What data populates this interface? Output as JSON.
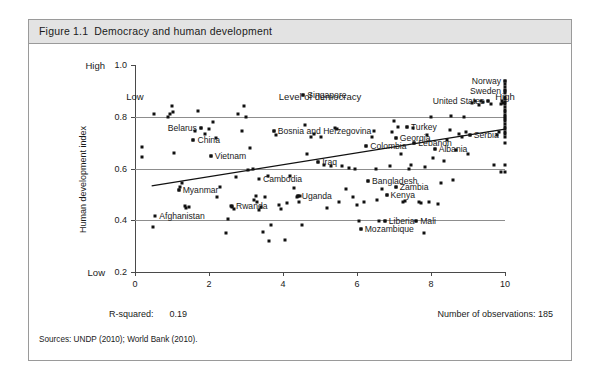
{
  "figure": {
    "number": "Figure 1.1",
    "title": "Democracy and human development"
  },
  "footer": {
    "rsquared_label": "R-squared:",
    "rsquared_value": "0.19",
    "observations": "Number of observations: 185",
    "sources": "Sources: UNDP (2010); World Bank (2010)."
  },
  "chart_data": {
    "type": "scatter",
    "title": "Democracy and human development",
    "xlabel": "Level of democracy",
    "ylabel": "Human development index",
    "xlim": [
      0,
      10
    ],
    "ylim": [
      0.2,
      1.0
    ],
    "xticks": [
      "0",
      "2",
      "4",
      "6",
      "8",
      "10"
    ],
    "xtick_values": [
      0,
      2,
      4,
      6,
      8,
      10
    ],
    "yticks": [
      "1.0",
      "0.8",
      "0.6",
      "0.4",
      "0.2"
    ],
    "ytick_values": [
      1.0,
      0.8,
      0.6,
      0.4,
      0.2
    ],
    "x_low_label": "Low",
    "x_high_label": "High",
    "y_low_label": "Low",
    "y_high_label": "High",
    "grid": "horizontal gridlines at 0.8, 0.6, 0.4",
    "gridline_values": [
      0.8,
      0.6,
      0.4
    ],
    "legend": "none",
    "r_squared": 0.19,
    "n_observations": 185,
    "marker_color": "#111111",
    "trendline": {
      "type": "linear fit",
      "x_start": 0.45,
      "y_start": 0.533,
      "x_end": 10.0,
      "y_end": 0.752,
      "color": "#111111"
    },
    "labeled_points": [
      {
        "name": "Singapore",
        "x": 4.55,
        "y": 0.885,
        "label_side": "right"
      },
      {
        "name": "Norway",
        "x": 10.0,
        "y": 0.94,
        "label_side": "left"
      },
      {
        "name": "Sweden",
        "x": 10.0,
        "y": 0.9,
        "label_side": "left"
      },
      {
        "name": "United States",
        "x": 9.55,
        "y": 0.86,
        "label_side": "left"
      },
      {
        "name": "Belarus",
        "x": 1.78,
        "y": 0.755,
        "label_side": "left"
      },
      {
        "name": "China",
        "x": 1.58,
        "y": 0.71,
        "label_side": "right"
      },
      {
        "name": "Vietnam",
        "x": 2.05,
        "y": 0.648,
        "label_side": "right"
      },
      {
        "name": "Bosnia and Herzegovina",
        "x": 3.75,
        "y": 0.745,
        "label_side": "right"
      },
      {
        "name": "Turkey",
        "x": 7.35,
        "y": 0.76,
        "label_side": "right"
      },
      {
        "name": "Serbia",
        "x": 9.05,
        "y": 0.73,
        "label_side": "right"
      },
      {
        "name": "Georgia",
        "x": 7.05,
        "y": 0.718,
        "label_side": "right"
      },
      {
        "name": "Lebanon",
        "x": 7.55,
        "y": 0.7,
        "label_side": "right"
      },
      {
        "name": "Colombia",
        "x": 6.25,
        "y": 0.688,
        "label_side": "right"
      },
      {
        "name": "Albania",
        "x": 8.1,
        "y": 0.675,
        "label_side": "right"
      },
      {
        "name": "Iraq",
        "x": 4.95,
        "y": 0.625,
        "label_side": "right"
      },
      {
        "name": "Cambodia",
        "x": 3.35,
        "y": 0.56,
        "label_side": "right"
      },
      {
        "name": "Myanmar",
        "x": 1.18,
        "y": 0.518,
        "label_side": "right"
      },
      {
        "name": "Bangladesh",
        "x": 6.3,
        "y": 0.55,
        "label_side": "right"
      },
      {
        "name": "Zambia",
        "x": 7.05,
        "y": 0.527,
        "label_side": "right"
      },
      {
        "name": "Kenya",
        "x": 6.8,
        "y": 0.497,
        "label_side": "right"
      },
      {
        "name": "Uganda",
        "x": 4.4,
        "y": 0.495,
        "label_side": "right"
      },
      {
        "name": "Rwanda",
        "x": 2.62,
        "y": 0.455,
        "label_side": "right"
      },
      {
        "name": "Afghanistan",
        "x": 0.55,
        "y": 0.415,
        "label_side": "right"
      },
      {
        "name": "Liberia",
        "x": 6.75,
        "y": 0.398,
        "label_side": "right"
      },
      {
        "name": "Mali",
        "x": 7.6,
        "y": 0.398,
        "label_side": "right"
      },
      {
        "name": "Mozambique",
        "x": 6.1,
        "y": 0.365,
        "label_side": "right"
      }
    ],
    "points": [
      [
        0.18,
        0.685
      ],
      [
        0.2,
        0.645
      ],
      [
        0.5,
        0.812
      ],
      [
        0.48,
        0.372
      ],
      [
        0.88,
        0.8
      ],
      [
        1.0,
        0.842
      ],
      [
        1.02,
        0.818
      ],
      [
        1.05,
        0.66
      ],
      [
        1.18,
        0.518
      ],
      [
        1.22,
        0.53
      ],
      [
        1.28,
        0.545
      ],
      [
        1.35,
        0.455
      ],
      [
        1.38,
        0.448
      ],
      [
        1.58,
        0.71
      ],
      [
        1.62,
        0.745
      ],
      [
        1.7,
        0.822
      ],
      [
        1.78,
        0.755
      ],
      [
        1.9,
        0.735
      ],
      [
        2.0,
        0.752
      ],
      [
        2.05,
        0.648
      ],
      [
        2.12,
        0.78
      ],
      [
        2.18,
        0.718
      ],
      [
        2.22,
        0.49
      ],
      [
        2.45,
        0.35
      ],
      [
        2.52,
        0.403
      ],
      [
        2.6,
        0.455
      ],
      [
        2.62,
        0.452
      ],
      [
        2.68,
        0.442
      ],
      [
        2.72,
        0.568
      ],
      [
        2.78,
        0.81
      ],
      [
        2.9,
        0.745
      ],
      [
        2.95,
        0.842
      ],
      [
        3.0,
        0.8
      ],
      [
        3.05,
        0.596
      ],
      [
        3.1,
        0.68
      ],
      [
        3.22,
        0.478
      ],
      [
        3.28,
        0.492
      ],
      [
        3.3,
        0.47
      ],
      [
        3.35,
        0.438
      ],
      [
        3.4,
        0.452
      ],
      [
        3.45,
        0.355
      ],
      [
        3.52,
        0.49
      ],
      [
        3.6,
        0.57
      ],
      [
        3.62,
        0.318
      ],
      [
        3.68,
        0.38
      ],
      [
        3.75,
        0.745
      ],
      [
        3.8,
        0.728
      ],
      [
        3.88,
        0.46
      ],
      [
        3.95,
        0.443
      ],
      [
        4.05,
        0.322
      ],
      [
        4.1,
        0.465
      ],
      [
        4.2,
        0.57
      ],
      [
        4.3,
        0.525
      ],
      [
        4.38,
        0.49
      ],
      [
        4.42,
        0.472
      ],
      [
        4.5,
        0.38
      ],
      [
        4.55,
        0.885
      ],
      [
        4.6,
        0.77
      ],
      [
        4.65,
        0.655
      ],
      [
        4.75,
        0.72
      ],
      [
        4.85,
        0.732
      ],
      [
        4.95,
        0.625
      ],
      [
        5.02,
        0.72
      ],
      [
        5.1,
        0.612
      ],
      [
        5.2,
        0.448
      ],
      [
        5.3,
        0.61
      ],
      [
        5.4,
        0.755
      ],
      [
        5.52,
        0.47
      ],
      [
        5.6,
        0.608
      ],
      [
        5.7,
        0.52
      ],
      [
        5.78,
        0.602
      ],
      [
        5.9,
        0.49
      ],
      [
        6.0,
        0.46
      ],
      [
        6.1,
        0.365
      ],
      [
        6.18,
        0.47
      ],
      [
        6.25,
        0.688
      ],
      [
        6.3,
        0.55
      ],
      [
        6.4,
        0.72
      ],
      [
        6.45,
        0.745
      ],
      [
        6.5,
        0.6
      ],
      [
        6.55,
        0.478
      ],
      [
        6.6,
        0.398
      ],
      [
        6.68,
        0.52
      ],
      [
        6.75,
        0.398
      ],
      [
        6.8,
        0.497
      ],
      [
        6.88,
        0.61
      ],
      [
        6.95,
        0.74
      ],
      [
        7.0,
        0.782
      ],
      [
        7.05,
        0.718
      ],
      [
        7.05,
        0.527
      ],
      [
        7.12,
        0.76
      ],
      [
        7.2,
        0.655
      ],
      [
        7.25,
        0.47
      ],
      [
        7.3,
        0.476
      ],
      [
        7.35,
        0.76
      ],
      [
        7.4,
        0.6
      ],
      [
        7.45,
        0.612
      ],
      [
        7.5,
        0.755
      ],
      [
        7.55,
        0.7
      ],
      [
        7.6,
        0.398
      ],
      [
        7.68,
        0.47
      ],
      [
        7.72,
        0.465
      ],
      [
        7.8,
        0.35
      ],
      [
        7.85,
        0.605
      ],
      [
        7.9,
        0.73
      ],
      [
        8.0,
        0.8
      ],
      [
        8.05,
        0.642
      ],
      [
        8.1,
        0.675
      ],
      [
        8.18,
        0.462
      ],
      [
        8.28,
        0.545
      ],
      [
        8.35,
        0.628
      ],
      [
        8.42,
        0.712
      ],
      [
        8.5,
        0.748
      ],
      [
        8.55,
        0.802
      ],
      [
        8.6,
        0.555
      ],
      [
        8.68,
        0.672
      ],
      [
        8.75,
        0.735
      ],
      [
        8.85,
        0.722
      ],
      [
        8.95,
        0.742
      ],
      [
        9.0,
        0.655
      ],
      [
        9.05,
        0.73
      ],
      [
        9.1,
        0.852
      ],
      [
        9.2,
        0.862
      ],
      [
        9.3,
        0.845
      ],
      [
        9.4,
        0.858
      ],
      [
        9.55,
        0.86
      ],
      [
        9.62,
        0.848
      ],
      [
        9.7,
        0.612
      ],
      [
        9.78,
        0.73
      ],
      [
        9.85,
        0.742
      ],
      [
        9.9,
        0.585
      ],
      [
        10.0,
        0.94
      ],
      [
        10.0,
        0.928
      ],
      [
        10.0,
        0.915
      ],
      [
        10.0,
        0.902
      ],
      [
        10.0,
        0.89
      ],
      [
        10.0,
        0.878
      ],
      [
        10.0,
        0.868
      ],
      [
        10.0,
        0.858
      ],
      [
        10.0,
        0.848
      ],
      [
        10.0,
        0.838
      ],
      [
        10.0,
        0.828
      ],
      [
        10.0,
        0.818
      ],
      [
        10.0,
        0.808
      ],
      [
        10.0,
        0.8
      ],
      [
        10.0,
        0.792
      ],
      [
        10.0,
        0.782
      ],
      [
        10.0,
        0.772
      ],
      [
        10.0,
        0.762
      ],
      [
        10.0,
        0.752
      ],
      [
        10.0,
        0.742
      ],
      [
        10.0,
        0.732
      ],
      [
        10.0,
        0.722
      ],
      [
        10.0,
        0.7
      ],
      [
        10.0,
        0.612
      ],
      [
        10.0,
        0.585
      ],
      [
        9.95,
        0.855
      ],
      [
        9.92,
        0.862
      ],
      [
        9.88,
        0.85
      ],
      [
        5.95,
        0.598
      ],
      [
        4.45,
        0.495
      ],
      [
        4.4,
        0.495
      ],
      [
        2.3,
        0.53
      ],
      [
        1.45,
        0.452
      ],
      [
        0.95,
        0.812
      ],
      [
        3.18,
        0.598
      ],
      [
        6.05,
        0.398
      ],
      [
        5.45,
        0.752
      ],
      [
        8.88,
        0.8
      ],
      [
        9.35,
        0.862
      ],
      [
        7.95,
        0.47
      ]
    ]
  }
}
